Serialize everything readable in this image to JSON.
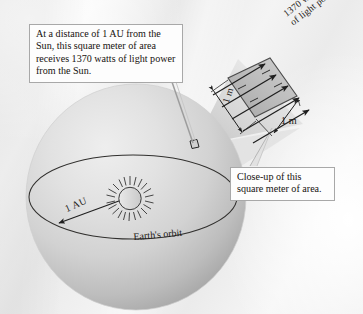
{
  "figure": {
    "background_color": "#f0f0f0"
  },
  "captions": {
    "main": "At a distance of 1 AU from the Sun, this square meter of area receives 1370 watts of light power from the Sun.",
    "closeup": "Close-up of this square meter of area."
  },
  "labels": {
    "power_line1": "1370 watts",
    "power_line2": "of light power",
    "distance": "1 AU",
    "orbit": "Earth's orbit",
    "side_left": "1 m",
    "side_right": "1 m"
  },
  "values": {
    "irradiance_watts": 1370,
    "distance_au": 1,
    "side_length_m": 1,
    "area_m2": 1
  },
  "colors": {
    "sphere_light": "#e3e3e3",
    "sphere_dark": "#a9a9a9",
    "patch_fill": "#b9b9b9",
    "line": "#2b2b2b",
    "leader": "#9d9d9d",
    "box_border": "#a8a8a8",
    "box_fill": "#fdfdfd"
  },
  "elements": {
    "sphere_name": "solar-radiation-sphere",
    "orbit_name": "earth-orbit-ellipse",
    "sun_name": "sun-symbol",
    "patch_name": "square-meter-patch",
    "ray_count": 4,
    "corona_spikes": 20
  }
}
